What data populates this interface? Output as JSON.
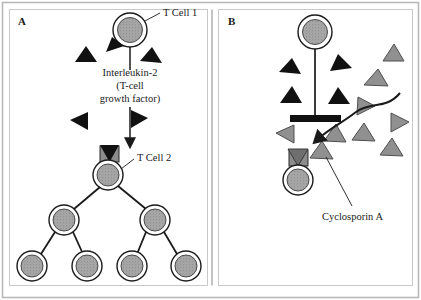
{
  "figure": {
    "title_panel_a_letter": "A",
    "title_panel_b_letter": "B",
    "background_color": "#ffffff",
    "frame_color": "#b9b9b9",
    "ink_color": "#1a1a1a",
    "cell_fill_color": "#9e9e9e",
    "cell_ring_color": "#ffffff",
    "receptor_color": "#8c8c8c",
    "il2_black_color": "#111111",
    "cyclosporin_gray_color": "#909090"
  },
  "panel_a": {
    "letter": "A",
    "labels": {
      "t_cell_1": "T Cell 1",
      "interleukin_line1": "Interleukin-2",
      "interleukin_line2": "(T-cell",
      "interleukin_line3": "growth factor)",
      "t_cell_2": "T Cell 2"
    },
    "cells": [
      {
        "name": "t-cell-1",
        "cx": 130,
        "cy": 30,
        "r_outer": 17,
        "r_inner": 12.5
      },
      {
        "name": "t-cell-2",
        "cx": 108,
        "cy": 175,
        "r_outer": 15,
        "r_inner": 11
      },
      {
        "name": "daughter-cell-left",
        "cx": 64,
        "cy": 220,
        "r_outer": 15,
        "r_inner": 11
      },
      {
        "name": "daughter-cell-right",
        "cx": 155,
        "cy": 220,
        "r_outer": 15,
        "r_inner": 11
      },
      {
        "name": "granddaughter-cell-1",
        "cx": 32,
        "cy": 266,
        "r_outer": 15,
        "r_inner": 11
      },
      {
        "name": "granddaughter-cell-2",
        "cx": 87,
        "cy": 266,
        "r_outer": 15,
        "r_inner": 11
      },
      {
        "name": "granddaughter-cell-3",
        "cx": 132,
        "cy": 266,
        "r_outer": 15,
        "r_inner": 11
      },
      {
        "name": "granddaughter-cell-4",
        "cx": 186,
        "cy": 266,
        "r_outer": 15,
        "r_inner": 11
      }
    ],
    "il2_molecules": [
      {
        "name": "il2-molecule-top-left-docked",
        "cx": 112,
        "cy": 44,
        "size": 11,
        "rotation": -35
      },
      {
        "name": "il2-molecule-left-upper",
        "cx": 84,
        "cy": 53,
        "size": 11,
        "rotation": 20
      },
      {
        "name": "il2-molecule-right-upper",
        "cx": 149,
        "cy": 55,
        "size": 11,
        "rotation": -25
      },
      {
        "name": "il2-molecule-left-lower",
        "cx": 78,
        "cy": 119,
        "size": 11,
        "rotation": -90
      },
      {
        "name": "il2-molecule-right-lower",
        "cx": 139,
        "cy": 117,
        "size": 11,
        "rotation": 90
      }
    ],
    "secretion_line": {
      "x": 130,
      "y_start": 48,
      "y_end": 68
    },
    "arrow": {
      "x": 130,
      "y_start": 104,
      "y_end": 146
    },
    "receptor": {
      "x": 100,
      "y": 146,
      "w": 18,
      "h": 15
    },
    "lineage_edges": [
      {
        "from": "t-cell-2",
        "to": "daughter-cell-left"
      },
      {
        "from": "t-cell-2",
        "to": "daughter-cell-right"
      },
      {
        "from": "daughter-cell-left",
        "to": "granddaughter-cell-1"
      },
      {
        "from": "daughter-cell-left",
        "to": "granddaughter-cell-2"
      },
      {
        "from": "daughter-cell-right",
        "to": "granddaughter-cell-3"
      },
      {
        "from": "daughter-cell-right",
        "to": "granddaughter-cell-4"
      }
    ],
    "leader_t_cell_1": {
      "x1": 147,
      "y1": 22,
      "x2": 160,
      "y2": 15
    },
    "leader_t_cell_2": {
      "x1": 121,
      "y1": 168,
      "x2": 135,
      "y2": 160
    }
  },
  "panel_b": {
    "letter": "B",
    "labels": {
      "cyclosporin": "Cyclosporin A"
    },
    "cells": [
      {
        "name": "t-cell-1-blocked",
        "cx": 315,
        "cy": 32,
        "r_outer": 17,
        "r_inner": 12.5
      },
      {
        "name": "t-cell-2-blocked",
        "cx": 298,
        "cy": 180,
        "r_outer": 15,
        "r_inner": 11
      }
    ],
    "block_stem": {
      "x": 315,
      "y_start": 49,
      "y_end": 115
    },
    "block_bar": {
      "x": 290,
      "y": 115,
      "w": 50,
      "h": 7
    },
    "il2_molecules": [
      {
        "name": "il2-molecule-left-upper",
        "cx": 288,
        "cy": 68,
        "size": 11,
        "rotation": 20
      },
      {
        "name": "il2-molecule-right-upper",
        "cx": 341,
        "cy": 62,
        "size": 11,
        "rotation": -20
      },
      {
        "name": "il2-molecule-left-lower",
        "cx": 291,
        "cy": 96,
        "size": 11,
        "rotation": -5
      },
      {
        "name": "il2-molecule-right-lower",
        "cx": 339,
        "cy": 97,
        "size": 11,
        "rotation": 10
      }
    ],
    "cyclosporin_molecules": [
      {
        "name": "cyclosporin-1",
        "cx": 394,
        "cy": 52,
        "size": 12,
        "rotation": 5
      },
      {
        "name": "cyclosporin-2",
        "cx": 376,
        "cy": 77,
        "size": 12,
        "rotation": -10
      },
      {
        "name": "cyclosporin-3",
        "cx": 366,
        "cy": 104,
        "size": 12,
        "rotation": 80
      },
      {
        "name": "cyclosporin-4",
        "cx": 399,
        "cy": 122,
        "size": 12,
        "rotation": 95
      },
      {
        "name": "cyclosporin-5",
        "cx": 286,
        "cy": 133,
        "size": 12,
        "rotation": -95
      },
      {
        "name": "cyclosporin-6",
        "cx": 336,
        "cy": 133,
        "size": 12,
        "rotation": 10
      },
      {
        "name": "cyclosporin-7",
        "cx": 364,
        "cy": 132,
        "size": 12,
        "rotation": 12
      },
      {
        "name": "cyclosporin-8",
        "cx": 392,
        "cy": 147,
        "size": 12,
        "rotation": 6
      },
      {
        "name": "cyclosporin-9",
        "cx": 322,
        "cy": 150,
        "size": 12,
        "rotation": 2
      }
    ],
    "receptor": {
      "x": 289,
      "y": 150,
      "w": 18,
      "h": 15
    },
    "receptor_il2": {
      "cx": 298,
      "cy": 152,
      "size": 11
    },
    "squiggle_path": "M 398 95 C 385 108, 372 104, 358 112 C 344 120, 330 126, 316 138",
    "squiggle_arrow_tip": {
      "x": 313,
      "y": 142
    },
    "leader_cyclosporin": {
      "x1": 327,
      "y1": 155,
      "x2": 352,
      "y2": 208
    }
  }
}
